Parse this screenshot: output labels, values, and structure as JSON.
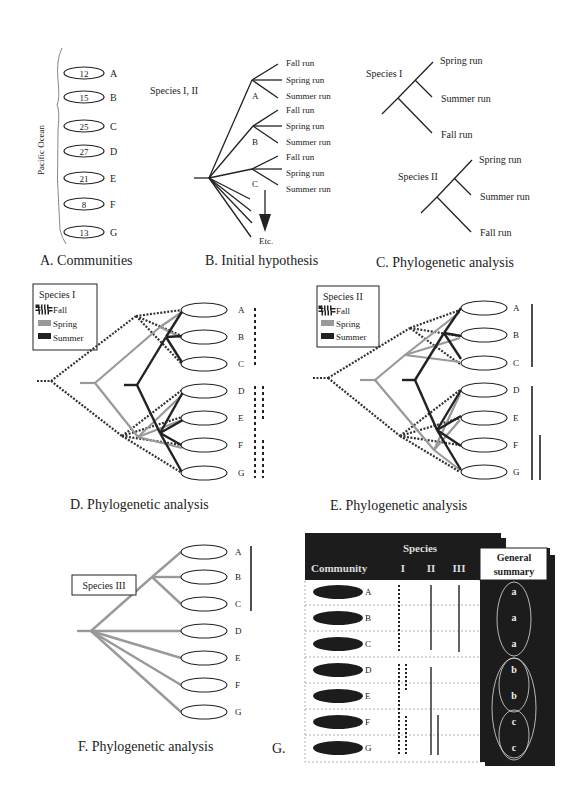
{
  "panelA": {
    "caption": "A. Communities",
    "ocean_label": "Pacific Ocean",
    "communities": [
      {
        "id": "A",
        "value": "12"
      },
      {
        "id": "B",
        "value": "15"
      },
      {
        "id": "C",
        "value": "25"
      },
      {
        "id": "D",
        "value": "27"
      },
      {
        "id": "E",
        "value": "21"
      },
      {
        "id": "F",
        "value": "8"
      },
      {
        "id": "G",
        "value": "13"
      }
    ]
  },
  "panelB": {
    "caption": "B. Initial hypothesis",
    "species_label": "Species I,  II",
    "nodes": [
      "A",
      "B",
      "C"
    ],
    "runs": [
      "Fall run",
      "Spring run",
      "Summer run"
    ],
    "etc_label": "Etc."
  },
  "panelC": {
    "caption": "C.  Phylogenetic analysis",
    "species1_label": "Species I",
    "species2_label": "Species II",
    "runs": [
      "Spring run",
      "Summer  run",
      "Fall run"
    ]
  },
  "panelD": {
    "caption": "D.  Phylogenetic analysis",
    "legend_title": "Species I",
    "legend": [
      "Fall",
      "Spring",
      "Summer"
    ],
    "communities": [
      "A",
      "B",
      "C",
      "D",
      "E",
      "F",
      "G"
    ]
  },
  "panelE": {
    "caption": "E.  Phylogenetic analysis",
    "legend_title": "Species II",
    "legend": [
      "Fall",
      "Spring",
      "Summer"
    ],
    "communities": [
      "A",
      "B",
      "C",
      "D",
      "E",
      "F",
      "G"
    ]
  },
  "panelF": {
    "caption": "F.  Phylogenetic analysis",
    "species_label": "Species III",
    "communities": [
      "A",
      "B",
      "C",
      "D",
      "E",
      "F",
      "G"
    ]
  },
  "panelG": {
    "caption": "G.",
    "header_species": "Species",
    "header_community": "Community",
    "columns": [
      "I",
      "II",
      "III"
    ],
    "summary_title_line1": "General",
    "summary_title_line2": "summary",
    "rows": [
      {
        "community": "A",
        "summary": "a"
      },
      {
        "community": "B",
        "summary": "a"
      },
      {
        "community": "C",
        "summary": "a"
      },
      {
        "community": "D",
        "summary": "b"
      },
      {
        "community": "E",
        "summary": "b"
      },
      {
        "community": "F",
        "summary": "c"
      },
      {
        "community": "G",
        "summary": "c"
      }
    ]
  },
  "colors": {
    "ink": "#222222",
    "spring_gray": "#9a9a9a",
    "table_dark": "#1c1c1c",
    "table_text": "#ffffff"
  }
}
